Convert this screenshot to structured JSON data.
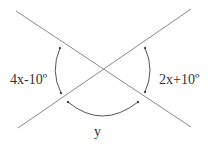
{
  "diagram": {
    "type": "intersecting-lines-angles",
    "colors": {
      "line": "#7a7a7a",
      "arc": "#555555",
      "text": "#333333",
      "background": "#ffffff"
    },
    "labels": {
      "left_angle": "4x-10º",
      "right_angle": "2x+10º",
      "bottom_angle": "y"
    }
  }
}
